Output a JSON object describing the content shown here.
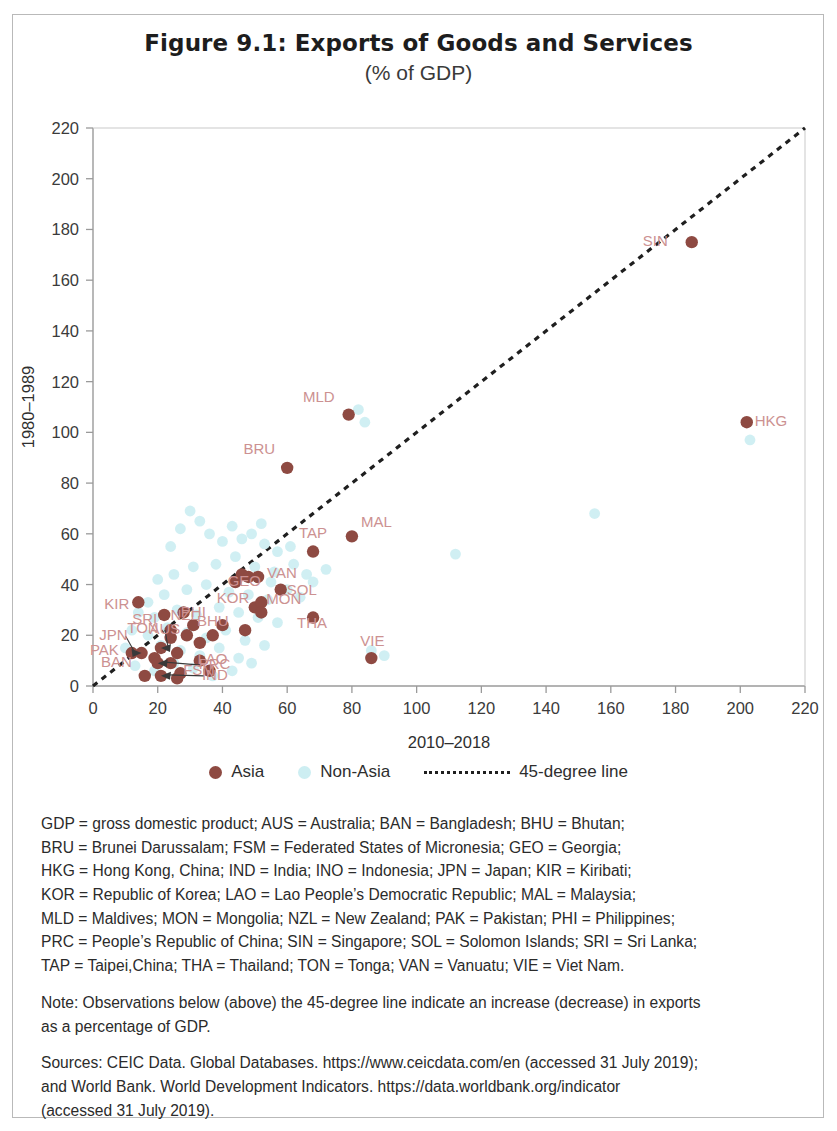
{
  "title": "Figure 9.1: Exports of Goods and Services",
  "subtitle": "(% of GDP)",
  "legend": {
    "asia_label": "Asia",
    "nonasia_label": "Non-Asia",
    "line_label": "45-degree line",
    "asia_color": "#8e4a42",
    "nonasia_color": "#cdeef2",
    "line_color": "#1f1f1f"
  },
  "notes": {
    "abbrev_lines": [
      "GDP = gross domestic product; AUS = Australia; BAN = Bangladesh; BHU = Bhutan;",
      "BRU = Brunei Darussalam; FSM = Federated States of Micronesia; GEO = Georgia;",
      "HKG = Hong Kong, China; IND = India; INO = Indonesia; JPN = Japan; KIR = Kiribati;",
      "KOR = Republic of Korea; LAO = Lao People’s Democratic Republic; MAL = Malaysia;",
      "MLD = Maldives; MON = Mongolia; NZL = New Zealand; PAK = Pakistan; PHI = Philippines;",
      "PRC = People’s Republic of China; SIN = Singapore; SOL = Solomon Islands; SRI = Sri Lanka;",
      "TAP = Taipei,China; THA = Thailand; TON = Tonga; VAN = Vanuatu; VIE = Viet Nam."
    ],
    "note_lines": [
      "Note: Observations below (above) the 45-degree line indicate an increase (decrease) in exports",
      "as a percentage of GDP."
    ],
    "sources_lines": [
      "Sources: CEIC Data. Global Databases. https://www.ceicdata.com/en (accessed 31 July 2019);",
      "and World Bank. World Development Indicators. https://data.worldbank.org/indicator",
      "(accessed 31 July 2019)."
    ]
  },
  "chart_data": {
    "type": "scatter",
    "title": "Figure 9.1: Exports of Goods and Services",
    "subtitle": "(% of GDP)",
    "xlabel": "2010–2018",
    "ylabel": "1980–1989",
    "xlim": [
      0,
      220
    ],
    "ylim": [
      0,
      220
    ],
    "xticks": [
      0,
      20,
      40,
      60,
      80,
      100,
      120,
      140,
      160,
      180,
      200,
      220
    ],
    "yticks": [
      0,
      20,
      40,
      60,
      80,
      100,
      120,
      140,
      160,
      180,
      200,
      220
    ],
    "grid": false,
    "legend_position": "below",
    "reference_line": {
      "label": "45-degree line",
      "from": [
        0,
        0
      ],
      "to": [
        220,
        220
      ],
      "style": "dotted"
    },
    "series": [
      {
        "name": "Asia",
        "color": "#8e4a42",
        "points": [
          {
            "label": "SIN",
            "x": 185,
            "y": 175,
            "label_dx": -24,
            "label_dy": 4
          },
          {
            "label": "HKG",
            "x": 202,
            "y": 104,
            "label_dx": 8,
            "label_dy": 4
          },
          {
            "label": "MLD",
            "x": 79,
            "y": 107,
            "label_dx": -14,
            "label_dy": -13
          },
          {
            "label": "BRU",
            "x": 60,
            "y": 86,
            "label_dx": -12,
            "label_dy": -14
          },
          {
            "label": "MAL",
            "x": 80,
            "y": 59,
            "label_dx": 9,
            "label_dy": -9
          },
          {
            "label": "TAP",
            "x": 68,
            "y": 53,
            "label_dx": 0,
            "label_dy": -14
          },
          {
            "label": "THA",
            "x": 68,
            "y": 27,
            "label_dx": -1,
            "label_dy": 10
          },
          {
            "label": "VIE",
            "x": 86,
            "y": 11,
            "label_dx": 1,
            "label_dy": -12
          },
          {
            "label": "GEO",
            "x": 48,
            "y": 43,
            "label_dx": -4,
            "label_dy": 9
          },
          {
            "label": "VAN",
            "x": 51,
            "y": 43,
            "label_dx": 9,
            "label_dy": 1
          },
          {
            "label": "SOL",
            "x": 58,
            "y": 38,
            "label_dx": 6,
            "label_dy": 5
          },
          {
            "label": "KOR",
            "x": 52,
            "y": 33,
            "label_dx": -12,
            "label_dy": 1
          },
          {
            "label": "MON",
            "x": 52,
            "y": 29,
            "label_dx": 5,
            "label_dy": -8
          },
          {
            "label": "KIR",
            "x": 14,
            "y": 33,
            "label_dx": -9,
            "label_dy": 7
          },
          {
            "label": "SRI",
            "x": 22,
            "y": 28,
            "label_dx": -7,
            "label_dy": 9
          },
          {
            "label": "NZL",
            "x": 28,
            "y": 29,
            "label_dx": 1,
            "label_dy": 8
          },
          {
            "label": "TON",
            "x": 24,
            "y": 22,
            "label_dx": -12,
            "label_dy": 3
          },
          {
            "label": "PHI",
            "x": 31,
            "y": 24,
            "label_dx": 0,
            "label_dy": -8
          },
          {
            "label": "BHU",
            "x": 37,
            "y": 20,
            "label_dx": 0,
            "label_dy": -9
          },
          {
            "label": "AUS",
            "x": 21,
            "y": 15,
            "label_dx": 4,
            "label_dy": -14,
            "leader": true
          },
          {
            "label": "JPN",
            "x": 15,
            "y": 13,
            "label_dx": -14,
            "label_dy": -13,
            "leader": true
          },
          {
            "label": "PAK",
            "x": 12,
            "y": 13,
            "label_dx": -13,
            "label_dy": 2
          },
          {
            "label": "PRC",
            "x": 20,
            "y": 9,
            "label_dx": 41,
            "label_dy": 6,
            "leader": true
          },
          {
            "label": "IND",
            "x": 21,
            "y": 4,
            "label_dx": 41,
            "label_dy": 4,
            "leader": true
          },
          {
            "label": "BAN",
            "x": 16,
            "y": 4,
            "label_dx": -13,
            "label_dy": -9
          },
          {
            "label": "FSM",
            "x": 26,
            "y": 3,
            "label_dx": 6,
            "label_dy": -3
          },
          {
            "label": "LAO",
            "x": 36,
            "y": 6,
            "label_dx": 3,
            "label_dy": -7
          }
        ],
        "unlabeled_points": [
          {
            "x": 24,
            "y": 19
          },
          {
            "x": 29,
            "y": 20
          },
          {
            "x": 33,
            "y": 17
          },
          {
            "x": 26,
            "y": 13
          },
          {
            "x": 44,
            "y": 41
          },
          {
            "x": 46,
            "y": 44
          },
          {
            "x": 50,
            "y": 31
          },
          {
            "x": 40,
            "y": 24
          },
          {
            "x": 19,
            "y": 11
          },
          {
            "x": 24,
            "y": 9
          },
          {
            "x": 33,
            "y": 10
          },
          {
            "x": 27,
            "y": 5
          },
          {
            "x": 47,
            "y": 22
          }
        ]
      },
      {
        "name": "Non-Asia",
        "color": "#cdeef2",
        "points": [
          {
            "x": 82,
            "y": 109
          },
          {
            "x": 84,
            "y": 104
          },
          {
            "x": 203,
            "y": 97
          },
          {
            "x": 155,
            "y": 68
          },
          {
            "x": 112,
            "y": 52
          },
          {
            "x": 30,
            "y": 69
          },
          {
            "x": 33,
            "y": 65
          },
          {
            "x": 27,
            "y": 62
          },
          {
            "x": 36,
            "y": 60
          },
          {
            "x": 40,
            "y": 57
          },
          {
            "x": 24,
            "y": 55
          },
          {
            "x": 46,
            "y": 58
          },
          {
            "x": 53,
            "y": 56
          },
          {
            "x": 57,
            "y": 53
          },
          {
            "x": 61,
            "y": 55
          },
          {
            "x": 44,
            "y": 51
          },
          {
            "x": 38,
            "y": 48
          },
          {
            "x": 31,
            "y": 47
          },
          {
            "x": 25,
            "y": 44
          },
          {
            "x": 20,
            "y": 42
          },
          {
            "x": 50,
            "y": 47
          },
          {
            "x": 56,
            "y": 45
          },
          {
            "x": 62,
            "y": 48
          },
          {
            "x": 66,
            "y": 44
          },
          {
            "x": 35,
            "y": 40
          },
          {
            "x": 29,
            "y": 38
          },
          {
            "x": 22,
            "y": 36
          },
          {
            "x": 17,
            "y": 33
          },
          {
            "x": 42,
            "y": 37
          },
          {
            "x": 48,
            "y": 36
          },
          {
            "x": 54,
            "y": 34
          },
          {
            "x": 60,
            "y": 38
          },
          {
            "x": 64,
            "y": 35
          },
          {
            "x": 14,
            "y": 29
          },
          {
            "x": 19,
            "y": 27
          },
          {
            "x": 26,
            "y": 30
          },
          {
            "x": 32,
            "y": 28
          },
          {
            "x": 39,
            "y": 31
          },
          {
            "x": 45,
            "y": 29
          },
          {
            "x": 51,
            "y": 27
          },
          {
            "x": 57,
            "y": 25
          },
          {
            "x": 12,
            "y": 22
          },
          {
            "x": 17,
            "y": 20
          },
          {
            "x": 23,
            "y": 23
          },
          {
            "x": 29,
            "y": 21
          },
          {
            "x": 35,
            "y": 19
          },
          {
            "x": 41,
            "y": 22
          },
          {
            "x": 47,
            "y": 18
          },
          {
            "x": 53,
            "y": 16
          },
          {
            "x": 10,
            "y": 15
          },
          {
            "x": 15,
            "y": 13
          },
          {
            "x": 21,
            "y": 16
          },
          {
            "x": 27,
            "y": 14
          },
          {
            "x": 33,
            "y": 12
          },
          {
            "x": 39,
            "y": 15
          },
          {
            "x": 45,
            "y": 11
          },
          {
            "x": 13,
            "y": 8
          },
          {
            "x": 19,
            "y": 6
          },
          {
            "x": 25,
            "y": 9
          },
          {
            "x": 31,
            "y": 7
          },
          {
            "x": 37,
            "y": 4
          },
          {
            "x": 43,
            "y": 6
          },
          {
            "x": 49,
            "y": 9
          },
          {
            "x": 55,
            "y": 41
          },
          {
            "x": 68,
            "y": 41
          },
          {
            "x": 72,
            "y": 46
          },
          {
            "x": 86,
            "y": 14
          },
          {
            "x": 90,
            "y": 12
          },
          {
            "x": 43,
            "y": 63
          },
          {
            "x": 49,
            "y": 60
          },
          {
            "x": 52,
            "y": 64
          }
        ]
      }
    ]
  }
}
